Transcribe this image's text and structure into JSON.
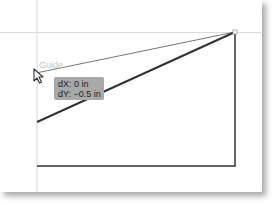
{
  "canvas": {
    "guide_label": "Guide",
    "guides": {
      "vertical_x": 37,
      "horizontal_y": 32,
      "color": "#d8d8d8"
    },
    "shapes": {
      "thin_line": {
        "from": [
          36,
          73
        ],
        "to": [
          235,
          32
        ],
        "color": "#777777"
      },
      "thick_diagonal": {
        "from": [
          37,
          122
        ],
        "to": [
          235,
          32
        ],
        "color": "#333333"
      },
      "right_edge": {
        "from": [
          235,
          32
        ],
        "to": [
          235,
          166
        ],
        "color": "#333333"
      },
      "bottom_edge": {
        "from": [
          37,
          166
        ],
        "to": [
          235,
          166
        ],
        "color": "#333333"
      }
    },
    "anchor_point": [
      235,
      32
    ]
  },
  "tooltip": {
    "dx_label": "dX: 0 in",
    "dy_label": "dY: −0.5 in",
    "background": "#a9a9a9"
  },
  "cursor": {
    "icon": "arrow-cursor-icon"
  }
}
